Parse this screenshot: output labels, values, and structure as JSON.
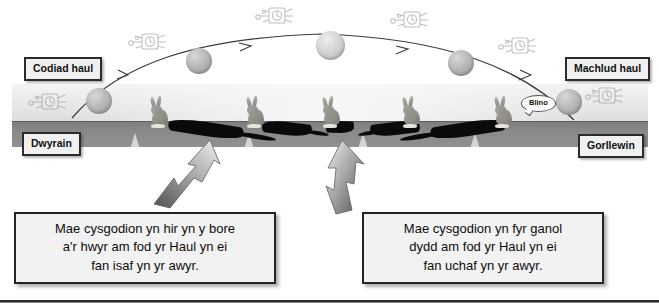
{
  "diagram": {
    "title_text_absent": "",
    "corner_labels": [
      {
        "name": "sunrise",
        "text": "Codiad haul"
      },
      {
        "name": "sunset",
        "text": "Machlud haul"
      },
      {
        "name": "east",
        "text": "Dwyrain"
      },
      {
        "name": "west",
        "text": "Gorllewin"
      }
    ],
    "speech_bubble": {
      "text": "Blino"
    },
    "captions": [
      {
        "name": "long-shadows",
        "lines": [
          "Mae cysgodion yn hir yn y bore",
          "a'r hwyr am fod yr Haul yn ei",
          "fan isaf yn yr awyr."
        ]
      },
      {
        "name": "short-shadows",
        "lines": [
          "Mae cysgodion yn fyr ganol",
          "dydd am fod yr Haul yn ei",
          "fan uchaf yn yr awyr."
        ]
      }
    ],
    "sun_positions": [
      {
        "x": 86,
        "y": 88,
        "d": 26
      },
      {
        "x": 186,
        "y": 48,
        "d": 26
      },
      {
        "x": 318,
        "y": 33,
        "d": 29
      },
      {
        "x": 448,
        "y": 50,
        "d": 26
      },
      {
        "x": 556,
        "y": 89,
        "d": 26
      }
    ],
    "rabbit_positions": [
      {
        "x": 148,
        "y": 100,
        "shadow_len": 78,
        "shadow_dir": "right"
      },
      {
        "x": 246,
        "y": 100,
        "shadow_len": 54,
        "shadow_dir": "right"
      },
      {
        "x": 324,
        "y": 100,
        "shadow_len": 28,
        "shadow_dir": "right"
      },
      {
        "x": 404,
        "y": 100,
        "shadow_len": 54,
        "shadow_dir": "left"
      },
      {
        "x": 496,
        "y": 100,
        "shadow_len": 78,
        "shadow_dir": "left"
      }
    ],
    "clock_positions": [
      {
        "x": 28,
        "y": 92
      },
      {
        "x": 128,
        "y": 32
      },
      {
        "x": 255,
        "y": 6
      },
      {
        "x": 390,
        "y": 10
      },
      {
        "x": 498,
        "y": 36
      },
      {
        "x": 585,
        "y": 86
      }
    ],
    "colors": {
      "sky_light": "#f4f4f4",
      "sky_dark": "#dcdcdc",
      "ground": "#8a8a8a",
      "sun": "#b8b8b8",
      "shadow": "#0a0a0a",
      "box_fill": "#f0f0f0",
      "box_border": "#2b2b2b",
      "arrow_dark": "#4a4a4a",
      "arrow_light": "#e9e9e9",
      "rule": "#2c2c2c"
    },
    "arc": {
      "arrow_count": 4,
      "description_not_shown": ""
    }
  }
}
